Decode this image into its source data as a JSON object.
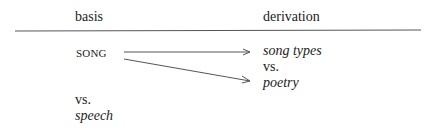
{
  "headers": {
    "left": "basis",
    "right": "derivation"
  },
  "basis": {
    "term": "SONG",
    "vs": "vs.",
    "contrast": "speech"
  },
  "derivation": {
    "item1": "song types",
    "vs": "vs.",
    "item2": "poetry"
  },
  "colors": {
    "text": "#222222",
    "rule": "#555555",
    "arrow": "#555555"
  }
}
